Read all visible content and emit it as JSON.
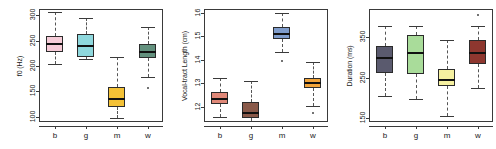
{
  "figure": {
    "type": "boxplot-panel-figure",
    "panel_count": 3,
    "background": "#ffffff",
    "frame_color": "#3a3a3a"
  },
  "chart_data": [
    {
      "type": "bar",
      "subtype": "boxplot",
      "title": "",
      "xlabel": "",
      "ylabel": "f0 (Hz)",
      "ylim": [
        90,
        312
      ],
      "yticks": [
        100,
        150,
        200,
        250,
        300
      ],
      "categories": [
        "b",
        "g",
        "m",
        "w"
      ],
      "grid": false,
      "legend": "none",
      "boxes": [
        {
          "category": "b",
          "color": "#f6ccd8",
          "min": 203,
          "q1": 227,
          "median": 243,
          "q3": 259,
          "max": 307,
          "outliers": []
        },
        {
          "category": "g",
          "color": "#8ed8dd",
          "min": 213,
          "q1": 218,
          "median": 239,
          "q3": 263,
          "max": 295,
          "outliers": []
        },
        {
          "category": "m",
          "color": "#f3c136",
          "min": 98,
          "q1": 120,
          "median": 136,
          "q3": 159,
          "max": 217,
          "outliers": []
        },
        {
          "category": "w",
          "color": "#63917e",
          "min": 178,
          "q1": 216,
          "median": 227,
          "q3": 243,
          "max": 276,
          "outliers": [
            157
          ]
        }
      ]
    },
    {
      "type": "bar",
      "subtype": "boxplot",
      "title": "",
      "xlabel": "",
      "ylabel": "Vocal-tract Length (cm)",
      "ylim": [
        11.35,
        16.15
      ],
      "yticks": [
        12,
        13,
        14,
        15,
        16
      ],
      "categories": [
        "b",
        "g",
        "m",
        "w"
      ],
      "grid": false,
      "legend": "none",
      "boxes": [
        {
          "category": "b",
          "color": "#e08878",
          "min": 11.55,
          "q1": 12.1,
          "median": 12.32,
          "q3": 12.62,
          "max": 13.2,
          "outliers": []
        },
        {
          "category": "g",
          "color": "#8a5a4a",
          "min": 11.4,
          "q1": 11.5,
          "median": 11.72,
          "q3": 12.2,
          "max": 13.08,
          "outliers": []
        },
        {
          "category": "m",
          "color": "#7f9ccb",
          "min": 14.32,
          "q1": 14.88,
          "median": 15.08,
          "q3": 15.38,
          "max": 15.98,
          "outliers": [
            13.93
          ]
        },
        {
          "category": "w",
          "color": "#f0a33a",
          "min": 12.05,
          "q1": 12.8,
          "median": 13.0,
          "q3": 13.22,
          "max": 13.9,
          "outliers": [
            11.72
          ]
        }
      ]
    },
    {
      "type": "bar",
      "subtype": "boxplot",
      "title": "",
      "xlabel": "",
      "ylabel": "Duration (ms)",
      "ylim": [
        140,
        420
      ],
      "yticks": [
        150,
        250,
        350
      ],
      "categories": [
        "b",
        "g",
        "m",
        "w"
      ],
      "grid": false,
      "legend": "none",
      "boxes": [
        {
          "category": "b",
          "color": "#5a5a6e",
          "min": 205,
          "q1": 262,
          "median": 298,
          "q3": 328,
          "max": 378,
          "outliers": []
        },
        {
          "category": "g",
          "color": "#a9dc9a",
          "min": 198,
          "q1": 258,
          "median": 312,
          "q3": 356,
          "max": 378,
          "outliers": []
        },
        {
          "category": "m",
          "color": "#f5f0a0",
          "min": 155,
          "q1": 228,
          "median": 244,
          "q3": 272,
          "max": 342,
          "outliers": []
        },
        {
          "category": "w",
          "color": "#8e372f",
          "min": 224,
          "q1": 283,
          "median": 312,
          "q3": 344,
          "max": 378,
          "outliers": [
            404
          ]
        }
      ]
    }
  ]
}
